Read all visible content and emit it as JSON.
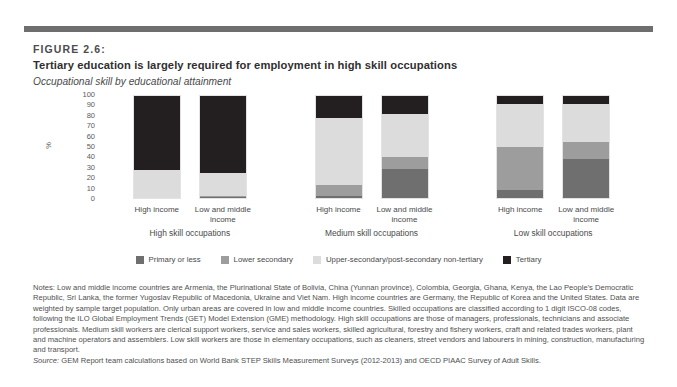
{
  "figure": {
    "label": "FIGURE 2.6:",
    "title": "Tertiary education is largely required for employment in high skill occupations",
    "subtitle": "Occupational skill by educational attainment"
  },
  "colors": {
    "primary_or_less": "#6f6f6f",
    "lower_secondary": "#9d9d9d",
    "upper_secondary": "#dcdcdc",
    "tertiary": "#231f20",
    "rule": "#6e6e6e"
  },
  "chart_data": {
    "type": "bar",
    "title": "Occupational skill by educational attainment",
    "xlabel": "",
    "ylabel": "%",
    "ylim": [
      0,
      100
    ],
    "yticks": [
      "100",
      "90",
      "80",
      "70",
      "60",
      "50",
      "40",
      "30",
      "20",
      "10",
      "0"
    ],
    "grid": false,
    "stacked": true,
    "legend_position": "bottom",
    "legend": [
      "Primary or less",
      "Lower secondary",
      "Upper-secondary/post-secondary non-tertiary",
      "Tertiary"
    ],
    "groups": [
      {
        "name": "High skill occupations",
        "bars": [
          {
            "label": "High income",
            "segments": [
              {
                "name": "Primary or less",
                "value": 0
              },
              {
                "name": "Lower secondary",
                "value": 0
              },
              {
                "name": "Upper-secondary/post-secondary non-tertiary",
                "value": 27
              },
              {
                "name": "Tertiary",
                "value": 73
              }
            ]
          },
          {
            "label": "Low and middle income",
            "segments": [
              {
                "name": "Primary or less",
                "value": 1
              },
              {
                "name": "Lower secondary",
                "value": 1
              },
              {
                "name": "Upper-secondary/post-secondary non-tertiary",
                "value": 23
              },
              {
                "name": "Tertiary",
                "value": 75
              }
            ]
          }
        ]
      },
      {
        "name": "Medium skill occupations",
        "bars": [
          {
            "label": "High income",
            "segments": [
              {
                "name": "Primary or less",
                "value": 2
              },
              {
                "name": "Lower secondary",
                "value": 11
              },
              {
                "name": "Upper-secondary/post-secondary non-tertiary",
                "value": 65
              },
              {
                "name": "Tertiary",
                "value": 22
              }
            ]
          },
          {
            "label": "Low and middle income",
            "segments": [
              {
                "name": "Primary or less",
                "value": 28
              },
              {
                "name": "Lower secondary",
                "value": 12
              },
              {
                "name": "Upper-secondary/post-secondary non-tertiary",
                "value": 42
              },
              {
                "name": "Tertiary",
                "value": 18
              }
            ]
          }
        ]
      },
      {
        "name": "Low skill occupations",
        "bars": [
          {
            "label": "High income",
            "segments": [
              {
                "name": "Primary or less",
                "value": 8
              },
              {
                "name": "Lower secondary",
                "value": 42
              },
              {
                "name": "Upper-secondary/post-secondary non-tertiary",
                "value": 42
              },
              {
                "name": "Tertiary",
                "value": 8
              }
            ]
          },
          {
            "label": "Low and middle income",
            "segments": [
              {
                "name": "Primary or less",
                "value": 38
              },
              {
                "name": "Lower secondary",
                "value": 17
              },
              {
                "name": "Upper-secondary/post-secondary non-tertiary",
                "value": 37
              },
              {
                "name": "Tertiary",
                "value": 8
              }
            ]
          }
        ]
      }
    ]
  },
  "notes": {
    "body": "Notes: Low and middle income countries are Armenia, the Plurinational State of Bolivia, China (Yunnan province), Colombia, Georgia, Ghana, Kenya, the Lao People's Democratic Republic, Sri Lanka, the former Yugoslav Republic of Macedonia, Ukraine and Viet Nam. High income countries are Germany, the Republic of Korea and the United States. Data are weighted by sample target population. Only urban areas are covered in low and middle income countries. Skilled occupations are classified according to 1 digit ISCO-08 codes, following the ILO Global Employment Trends (GET) Model Extension (GME) methodology. High skill occupations are those of managers, professionals, technicians and associate professionals. Medium skill workers are clerical support workers, service and sales workers, skilled agricultural, forestry and fishery workers, craft and related trades workers, plant and machine operators and assemblers. Low skill workers are those in elementary occupations, such as cleaners, street vendors and labourers in mining, construction, manufacturing and transport.",
    "source_label": "Source:",
    "source_text": " GEM Report team calculations based on World Bank STEP Skills Measurement Surveys (2012-2013) and OECD PIAAC Survey of Adult Skills."
  }
}
